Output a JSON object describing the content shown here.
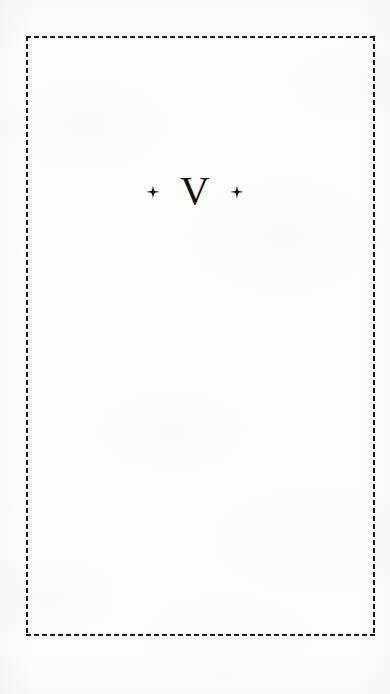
{
  "page": {
    "kind": "scanned-book-page",
    "part_divider": true,
    "paper_color": "#fdfdfc",
    "ink_color": "#191917"
  },
  "frame": {
    "style": "dashed",
    "color": "#191917",
    "thickness_px": 2,
    "dash_px": 5,
    "gap_px": 3
  },
  "heading": {
    "numeral": "V",
    "ornament_left": "four-pointed-star-ornament",
    "ornament_right": "four-pointed-star-ornament",
    "ornament_glyph": "✦"
  },
  "body": {
    "content": ""
  }
}
